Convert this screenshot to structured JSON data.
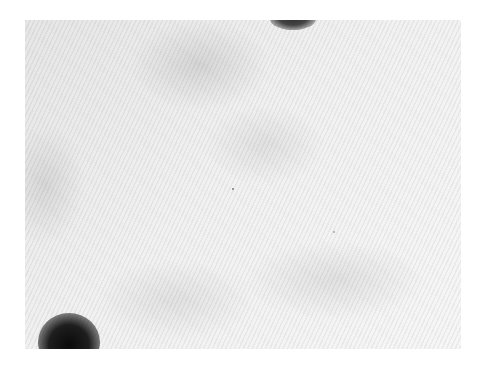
{
  "image": {
    "description": "Grayscale photograph of a light textured surface with diagonal stripe pattern and two dark circular blobs",
    "colors": {
      "background": "#ffffff",
      "surface": "#f0f0f0",
      "blob": "#111111"
    }
  }
}
